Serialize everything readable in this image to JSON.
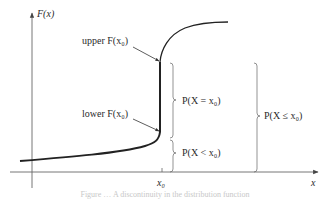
{
  "diagram": {
    "type": "cumulative distribution function with jump discontinuity",
    "axes": {
      "y_label": "F(x)",
      "x_label": "x",
      "x_tick_label": "x0"
    },
    "labels": {
      "upper": "upper F(x₀)",
      "lower": "lower F(x₀)",
      "p_equal": "P(X = x₀)",
      "p_less": "P(X < x₀)",
      "p_leq": "P(X ≤ x₀)",
      "x0": "x₀"
    },
    "caption": "Figure … A discontinuity in the distribution function",
    "colors": {
      "curve": "#222222",
      "axis": "#555555",
      "text": "#2a2a2a"
    }
  }
}
